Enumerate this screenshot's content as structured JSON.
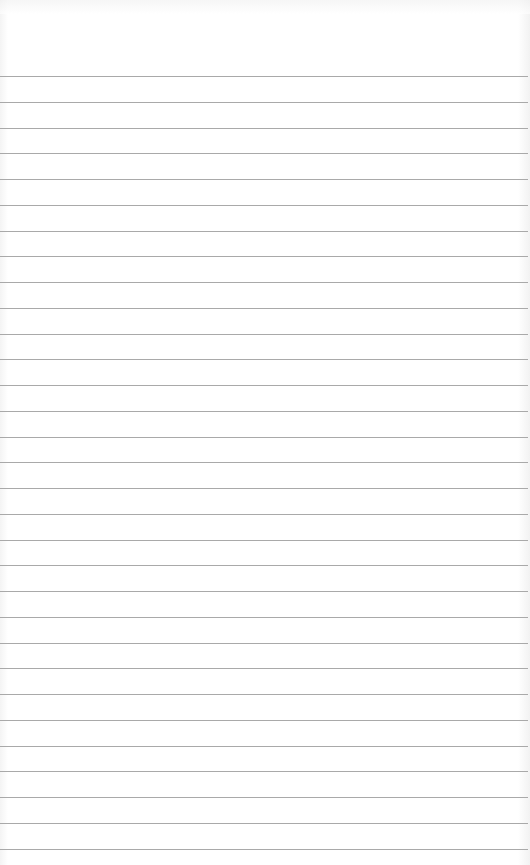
{
  "page": {
    "type": "ruled-notepad-page",
    "line_count": 31,
    "line_color": "#a9a9a9",
    "background_color": "#ffffff",
    "text": ""
  }
}
